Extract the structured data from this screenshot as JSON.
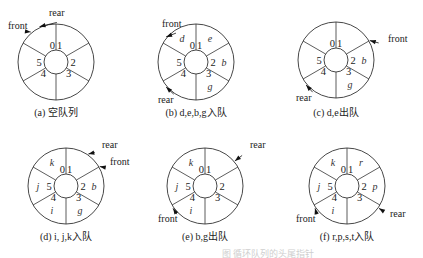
{
  "figure": {
    "slots": 6,
    "slot_indices": [
      "0",
      "1",
      "2",
      "3",
      "4",
      "5"
    ],
    "bottom_caption_faint": "图 循环队列的头尾指针"
  },
  "panels": [
    {
      "id": "a",
      "caption": "(a) 空队列",
      "center": [
        56,
        62
      ],
      "elements": {},
      "pointers": [
        {
          "name": "front",
          "label": "front",
          "slot_boundary_angle": -130,
          "text_pos": [
            8,
            29
          ]
        },
        {
          "name": "rear",
          "label": "rear",
          "slot_boundary_angle": -115,
          "text_pos": [
            49,
            16
          ]
        }
      ]
    },
    {
      "id": "b",
      "caption": "(b) d,e,b,g入队",
      "center": [
        196,
        62
      ],
      "elements": {
        "0": "d",
        "1": "e",
        "2": "b",
        "3": "g"
      },
      "pointers": [
        {
          "name": "front",
          "label": "front",
          "slot_boundary_angle": -140,
          "text_pos": [
            162,
            27
          ]
        },
        {
          "name": "rear",
          "label": "rear",
          "slot_boundary_angle": 140,
          "text_pos": [
            158,
            103
          ]
        }
      ]
    },
    {
      "id": "c",
      "caption": "(c) d,e出队",
      "center": [
        336,
        60
      ],
      "elements": {
        "2": "b",
        "3": "g"
      },
      "pointers": [
        {
          "name": "front",
          "label": "front",
          "slot_boundary_angle": -30,
          "text_pos": [
            388,
            42
          ]
        },
        {
          "name": "rear",
          "label": "rear",
          "slot_boundary_angle": 140,
          "text_pos": [
            296,
            101
          ]
        }
      ]
    },
    {
      "id": "d",
      "caption": "(d) i, j,k入队",
      "center": [
        66,
        186
      ],
      "elements": {
        "0": "k",
        "2": "b",
        "3": "g",
        "4": "i",
        "5": "j"
      },
      "pointers": [
        {
          "name": "rear",
          "label": "rear",
          "slot_boundary_angle": -55,
          "text_pos": [
            102,
            148
          ]
        },
        {
          "name": "front",
          "label": "front",
          "slot_boundary_angle": -30,
          "text_pos": [
            110,
            165
          ]
        }
      ]
    },
    {
      "id": "e",
      "caption": "(e) b,g出队",
      "center": [
        205,
        186
      ],
      "elements": {
        "0": "k",
        "4": "i",
        "5": "j"
      },
      "pointers": [
        {
          "name": "rear",
          "label": "rear",
          "slot_boundary_angle": -40,
          "text_pos": [
            250,
            148
          ]
        },
        {
          "name": "front",
          "label": "front",
          "slot_boundary_angle": 145,
          "text_pos": [
            158,
            222
          ]
        }
      ]
    },
    {
      "id": "f",
      "caption": "(f) r,p,s,t入队",
      "center": [
        347,
        186
      ],
      "elements": {
        "0": "k",
        "1": "r",
        "2": "p",
        "4": "i",
        "5": "j"
      },
      "pointers": [
        {
          "name": "front",
          "label": "front",
          "slot_boundary_angle": 145,
          "text_pos": [
            296,
            222
          ]
        },
        {
          "name": "rear",
          "label": "rear",
          "slot_boundary_angle": 35,
          "text_pos": [
            390,
            217
          ]
        }
      ]
    }
  ]
}
